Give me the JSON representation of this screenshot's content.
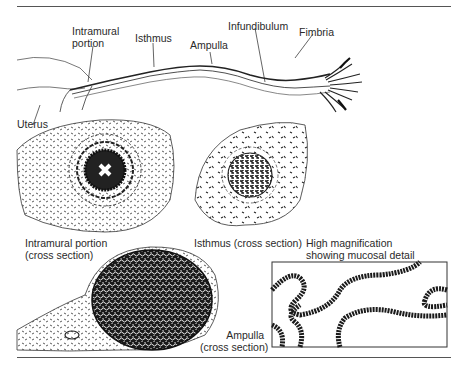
{
  "figure": {
    "labels": {
      "intramural": [
        "Intramural",
        "portion"
      ],
      "isthmus": "Isthmus",
      "ampulla": "Ampulla",
      "infundibulum": "Infundibulum",
      "fimbria": "Fimbria",
      "uterus": "Uterus"
    },
    "cross_sections": {
      "intramural": [
        "Intramural portion",
        "(cross section)"
      ],
      "isthmus": "Isthmus (cross section)",
      "ampulla": [
        "Ampulla",
        "(cross section)"
      ],
      "detail": [
        "High magnification",
        "showing mucosal detail"
      ]
    }
  },
  "colors": {
    "ink": "#1a1a1a",
    "rule": "#555555",
    "background": "#ffffff"
  }
}
